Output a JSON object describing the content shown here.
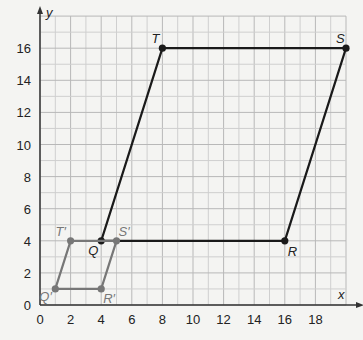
{
  "chart_data": {
    "type": "scatter",
    "title": "",
    "xlabel": "x",
    "ylabel": "y",
    "xlim": [
      0,
      20
    ],
    "ylim": [
      0,
      18
    ],
    "grid": true,
    "x_ticks": [
      0,
      2,
      4,
      6,
      8,
      10,
      12,
      14,
      16,
      18
    ],
    "y_ticks": [
      0,
      2,
      4,
      6,
      8,
      10,
      12,
      14,
      16
    ],
    "series": [
      {
        "name": "QRST",
        "closed": true,
        "color": "#1a1a1a",
        "points": [
          {
            "label": "Q",
            "x": 4,
            "y": 4
          },
          {
            "label": "R",
            "x": 16,
            "y": 4
          },
          {
            "label": "S",
            "x": 20,
            "y": 16
          },
          {
            "label": "T",
            "x": 8,
            "y": 16
          }
        ]
      },
      {
        "name": "Q'R'S'T'",
        "closed": true,
        "color": "#777777",
        "points": [
          {
            "label": "Q'",
            "x": 1,
            "y": 1
          },
          {
            "label": "R'",
            "x": 4,
            "y": 1
          },
          {
            "label": "S'",
            "x": 5,
            "y": 4
          },
          {
            "label": "T'",
            "x": 2,
            "y": 4
          }
        ]
      }
    ]
  },
  "labels": {
    "x_axis": "x",
    "y_axis": "y",
    "x_ticks": [
      "0",
      "2",
      "4",
      "6",
      "8",
      "10",
      "12",
      "14",
      "16",
      "18"
    ],
    "y_ticks": [
      "0",
      "2",
      "4",
      "6",
      "8",
      "10",
      "12",
      "14",
      "16"
    ],
    "points": {
      "Q": "Q",
      "R": "R",
      "S": "S",
      "T": "T",
      "Qp": "Q′",
      "Rp": "R′",
      "Sp": "S′",
      "Tp": "T′"
    }
  }
}
